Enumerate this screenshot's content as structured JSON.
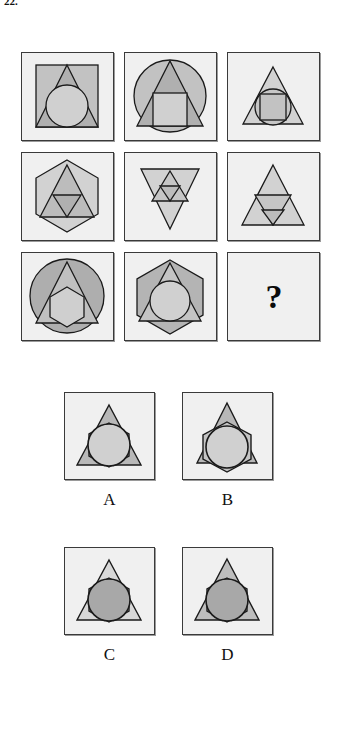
{
  "item": {
    "number": "22.",
    "type": "figural-matrix-reasoning",
    "missing_cell_symbol": "?"
  },
  "palette": {
    "page_background": "#ffffff",
    "cell_background": "#f0f0f0",
    "cell_border": "#3a3a3a",
    "cell_shadow": "#9a9a9a",
    "shape_stroke": "#1a1a1a",
    "fill_light": "#d8d8d8",
    "fill_medium": "#c2c2c2",
    "fill_dark": "#a8a8a8",
    "fill_darker": "#999999",
    "question_mark_color": "#0a0a0a"
  },
  "matrix": {
    "rows": 3,
    "columns": 3,
    "cells": [
      {
        "position": "row1-col1",
        "index": 1,
        "description": "square containing triangle containing circle",
        "shapes": [
          "square",
          "triangle",
          "circle"
        ]
      },
      {
        "position": "row1-col2",
        "index": 2,
        "description": "circle containing triangle containing square",
        "shapes": [
          "circle",
          "triangle",
          "square"
        ]
      },
      {
        "position": "row1-col3",
        "index": 3,
        "description": "triangle containing circle containing square",
        "shapes": [
          "triangle",
          "circle",
          "square"
        ]
      },
      {
        "position": "row2-col1",
        "index": 4,
        "description": "hexagon containing triangle containing inverted triangle",
        "shapes": [
          "hexagon",
          "triangle",
          "inverted-triangle"
        ]
      },
      {
        "position": "row2-col2",
        "index": 5,
        "description": "inverted triangle containing triangle containing inverted triangle",
        "shapes": [
          "inverted-triangle",
          "triangle",
          "inverted-triangle"
        ]
      },
      {
        "position": "row2-col3",
        "index": 6,
        "description": "triangle containing inverted triangle containing inverted triangle",
        "shapes": [
          "triangle",
          "inverted-triangle",
          "inverted-triangle"
        ]
      },
      {
        "position": "row3-col1",
        "index": 7,
        "description": "circle containing triangle containing hexagon",
        "shapes": [
          "circle",
          "triangle",
          "hexagon"
        ]
      },
      {
        "position": "row3-col2",
        "index": 8,
        "description": "hexagon containing triangle containing circle",
        "shapes": [
          "hexagon",
          "triangle",
          "circle"
        ]
      },
      {
        "position": "row3-col3",
        "index": 9,
        "description": "missing cell marked with a question mark",
        "shapes": [],
        "label": "?"
      }
    ]
  },
  "answer_options": [
    {
      "label": "A",
      "description": "medium-gray triangle containing hexagon containing light circle",
      "shapes": [
        "triangle",
        "hexagon",
        "circle"
      ],
      "triangle_fill": "#b8b8b8",
      "circle_fill": "#d0d0d0"
    },
    {
      "label": "B",
      "description": "medium-gray triangle with hexagon overlapping the sides, light circle inside",
      "shapes": [
        "triangle",
        "hexagon",
        "circle"
      ],
      "triangle_fill": "#b8b8b8",
      "circle_fill": "#d0d0d0"
    },
    {
      "label": "C",
      "description": "light triangle containing hexagon containing dark circle",
      "shapes": [
        "triangle",
        "hexagon",
        "circle"
      ],
      "triangle_fill": "#d8d8d8",
      "circle_fill": "#a8a8a8"
    },
    {
      "label": "D",
      "description": "medium-gray triangle containing hexagon containing dark circle",
      "shapes": [
        "triangle",
        "hexagon",
        "circle"
      ],
      "triangle_fill": "#bdbdbd",
      "circle_fill": "#a8a8a8"
    }
  ]
}
